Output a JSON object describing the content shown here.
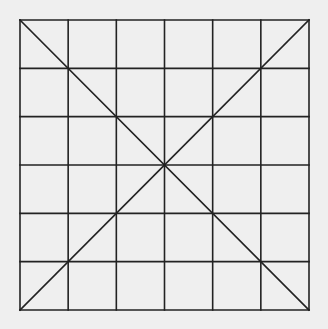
{
  "diagram": {
    "type": "grid-with-diagonals",
    "rows": 6,
    "cols": 6,
    "bounds": {
      "left": 20,
      "top": 20,
      "right": 309,
      "bottom": 310
    },
    "diagonals": [
      "top-left-to-bottom-right",
      "top-right-to-bottom-left"
    ],
    "colors": {
      "background": "#efefef",
      "line": "#222222"
    },
    "line_width": 1.6
  }
}
